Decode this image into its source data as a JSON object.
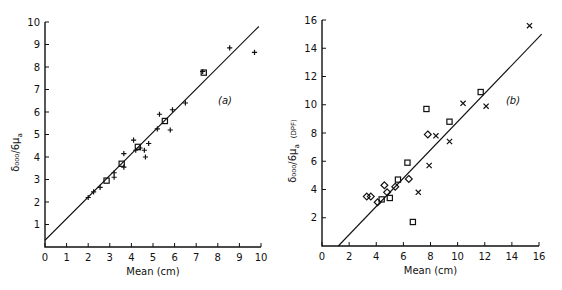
{
  "chart_data": [
    {
      "type": "scatter",
      "panel_label": "(a)",
      "title": "",
      "xlabel": "Mean (cm)",
      "ylabel": "δ₀₀₀/6μa",
      "xlim": [
        0,
        10
      ],
      "ylim": [
        0,
        10
      ],
      "xticks": [
        0,
        1,
        2,
        3,
        4,
        5,
        6,
        7,
        8,
        9,
        10
      ],
      "yticks": [
        1,
        2,
        3,
        4,
        5,
        6,
        7,
        8,
        9,
        10
      ],
      "grid": false,
      "fit_line": {
        "x": [
          0,
          9.9
        ],
        "y": [
          0.3,
          9.8
        ]
      },
      "series": [
        {
          "name": "plus",
          "marker": "+",
          "points": [
            [
              2.0,
              2.2
            ],
            [
              2.25,
              2.45
            ],
            [
              2.55,
              2.65
            ],
            [
              3.2,
              3.1
            ],
            [
              3.2,
              3.3
            ],
            [
              3.65,
              3.55
            ],
            [
              3.65,
              4.15
            ],
            [
              4.1,
              4.75
            ],
            [
              4.2,
              4.3
            ],
            [
              4.4,
              4.4
            ],
            [
              4.6,
              4.3
            ],
            [
              4.65,
              4.0
            ],
            [
              4.8,
              4.6
            ],
            [
              5.2,
              5.25
            ],
            [
              5.3,
              5.9
            ],
            [
              5.8,
              5.2
            ],
            [
              5.9,
              6.1
            ],
            [
              6.5,
              6.4
            ],
            [
              7.3,
              7.8
            ],
            [
              8.55,
              8.85
            ],
            [
              9.7,
              8.65
            ]
          ]
        },
        {
          "name": "square",
          "marker": "square",
          "points": [
            [
              2.85,
              2.95
            ],
            [
              3.55,
              3.7
            ],
            [
              4.3,
              4.45
            ],
            [
              5.55,
              5.6
            ],
            [
              7.35,
              7.75
            ]
          ]
        }
      ]
    },
    {
      "type": "scatter",
      "panel_label": "(b)",
      "title": "",
      "xlabel": "Mean (cm)",
      "ylabel": "δ₀₀₀/6μa (DPF)",
      "xlim": [
        0,
        16
      ],
      "ylim": [
        0,
        16
      ],
      "xticks": [
        0,
        2,
        4,
        6,
        8,
        10,
        12,
        14,
        16
      ],
      "yticks": [
        2,
        4,
        6,
        8,
        10,
        12,
        14,
        16
      ],
      "grid": false,
      "fit_line": {
        "x": [
          1.2,
          16.2
        ],
        "y": [
          0,
          15.0
        ]
      },
      "series": [
        {
          "name": "diamond",
          "marker": "diamond",
          "points": [
            [
              3.3,
              3.5
            ],
            [
              3.6,
              3.5
            ],
            [
              4.1,
              3.1
            ],
            [
              4.6,
              4.3
            ],
            [
              4.8,
              3.8
            ],
            [
              5.4,
              4.2
            ],
            [
              6.4,
              4.75
            ],
            [
              7.8,
              7.9
            ]
          ]
        },
        {
          "name": "square",
          "marker": "square",
          "points": [
            [
              4.4,
              3.3
            ],
            [
              5.0,
              3.4
            ],
            [
              5.6,
              4.7
            ],
            [
              6.3,
              5.9
            ],
            [
              6.7,
              1.7
            ],
            [
              7.7,
              9.7
            ],
            [
              9.4,
              8.8
            ],
            [
              11.7,
              10.9
            ]
          ]
        },
        {
          "name": "cross",
          "marker": "x",
          "points": [
            [
              7.1,
              3.8
            ],
            [
              7.9,
              5.7
            ],
            [
              8.4,
              7.8
            ],
            [
              9.4,
              7.4
            ],
            [
              10.4,
              10.1
            ],
            [
              12.1,
              9.9
            ],
            [
              15.3,
              15.6
            ]
          ]
        }
      ]
    }
  ],
  "labels": {
    "a": {
      "panel": "(a)",
      "xlabel": "Mean (cm)",
      "ylabel_main": "δ₀₀₀/6μ",
      "ylabel_sub": "a"
    },
    "b": {
      "panel": "(b)",
      "xlabel": "Mean (cm)",
      "ylabel_main": "δ₀₀₀/6μ",
      "ylabel_sub": "a",
      "ylabel_extra": "(DPF)"
    }
  }
}
